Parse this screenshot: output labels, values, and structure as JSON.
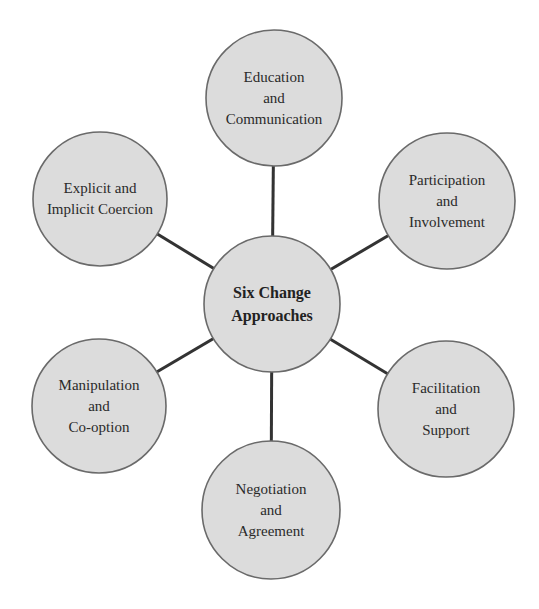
{
  "diagram": {
    "type": "hub-and-spoke",
    "center": {
      "id": "center",
      "label": "Six Change\nApproaches",
      "cx": 272,
      "cy": 304,
      "r": 68
    },
    "nodes": [
      {
        "id": "education",
        "label": "Education\nand\nCommunication",
        "cx": 274,
        "cy": 98,
        "r": 68
      },
      {
        "id": "participation",
        "label": "Participation\nand\nInvolvement",
        "cx": 447,
        "cy": 201,
        "r": 68
      },
      {
        "id": "facilitation",
        "label": "Facilitation\nand\nSupport",
        "cx": 446,
        "cy": 409,
        "r": 68
      },
      {
        "id": "negotiation",
        "label": "Negotiation\nand\nAgreement",
        "cx": 271,
        "cy": 510,
        "r": 69
      },
      {
        "id": "manipulation",
        "label": "Manipulation\nand\nCo-option",
        "cx": 99,
        "cy": 406,
        "r": 67
      },
      {
        "id": "coercion",
        "label": "Explicit and\nImplicit Coercion",
        "cx": 100,
        "cy": 199,
        "r": 67
      }
    ],
    "colors": {
      "node_fill": "#dcdcdc",
      "node_stroke": "#6a6a6a",
      "connector": "#333333",
      "text": "#2a2a2a"
    }
  }
}
